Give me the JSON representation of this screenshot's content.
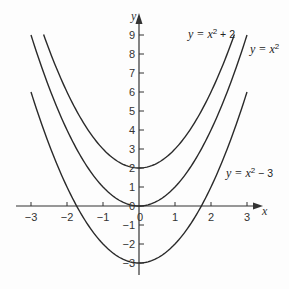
{
  "chart_data": {
    "type": "line",
    "title": "",
    "xlabel": "x",
    "ylabel": "y",
    "xlim": [
      -3.2,
      3.5
    ],
    "ylim": [
      -3.8,
      9.8
    ],
    "xticks": [
      -3,
      -2,
      -1,
      0,
      1,
      2,
      3
    ],
    "yticks": [
      -3,
      -2,
      -1,
      0,
      1,
      2,
      3,
      4,
      5,
      6,
      7,
      8,
      9
    ],
    "grid": false,
    "legend": "inline labels",
    "series": [
      {
        "name": "y = x^2 + 2",
        "label_pre": "y = x",
        "label_sup": "2",
        "label_post": " + 2",
        "shift": 2,
        "x_range": [
          -2.65,
          2.65
        ]
      },
      {
        "name": "y = x^2",
        "label_pre": "y = x",
        "label_sup": "2",
        "label_post": "",
        "shift": 0,
        "x_range": [
          -3,
          3
        ]
      },
      {
        "name": "y = x^2 - 3",
        "label_pre": "y = x",
        "label_sup": "2",
        "label_post": " − 3",
        "shift": -3,
        "x_range": [
          -3,
          3
        ]
      }
    ]
  },
  "axes": {
    "x_label": "x",
    "y_label": "y",
    "x_tick_labels": [
      "−3",
      "−2",
      "−1",
      "0",
      "1",
      "2",
      "3"
    ],
    "y_tick_labels": [
      "9",
      "8",
      "7",
      "6",
      "5",
      "4",
      "3",
      "2",
      "1",
      "0",
      "−1",
      "−2",
      "−3"
    ]
  },
  "labels": {
    "top_curve": {
      "pre": "y = x",
      "sup": "2",
      "post": " + 2"
    },
    "middle_curve": {
      "pre": "y = x",
      "sup": "2",
      "post": ""
    },
    "bottom_curve": {
      "pre": "y = x",
      "sup": "2",
      "post": " − 3"
    }
  },
  "colors": {
    "curve": "#2a2a2a",
    "axis": "#333333",
    "background": "#fdfdfd"
  }
}
